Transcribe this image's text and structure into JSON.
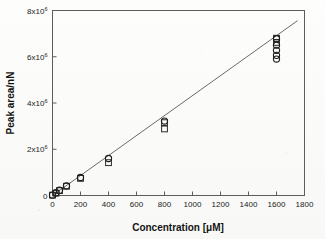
{
  "figure": {
    "background_color": "#fbfbfa",
    "ink_color": "#1a1a1a"
  },
  "chart_data": {
    "type": "scatter",
    "title": "",
    "xlabel": "Concentration [μM]",
    "ylabel": "Peak area/nN",
    "xlim": [
      0,
      1800
    ],
    "ylim": [
      0,
      8000000
    ],
    "xticks": [
      0,
      200,
      400,
      600,
      800,
      1000,
      1200,
      1400,
      1600,
      1800
    ],
    "xtick_labels": [
      "0",
      "200",
      "400",
      "600",
      "800",
      "1000",
      "1200",
      "1400",
      "1600",
      "1800"
    ],
    "yticks": [
      0,
      2000000,
      4000000,
      6000000,
      8000000
    ],
    "ytick_labels": [
      "0",
      "2x10",
      "4x10",
      "6x10",
      "8x10"
    ],
    "ytick_exponent": "6",
    "grid": false,
    "legend": false,
    "legend_position": "none",
    "tick_direction": "in",
    "frame": "box",
    "series": [
      {
        "name": "circles",
        "marker": "open-circle",
        "points": [
          {
            "x": 0,
            "y": 20000
          },
          {
            "x": 25,
            "y": 120000
          },
          {
            "x": 50,
            "y": 230000
          },
          {
            "x": 100,
            "y": 420000
          },
          {
            "x": 200,
            "y": 780000
          },
          {
            "x": 400,
            "y": 1600000
          },
          {
            "x": 800,
            "y": 3220000
          },
          {
            "x": 1600,
            "y": 6780000
          },
          {
            "x": 1600,
            "y": 6500000
          },
          {
            "x": 1600,
            "y": 6280000
          },
          {
            "x": 1600,
            "y": 6060000
          },
          {
            "x": 1600,
            "y": 5900000
          }
        ]
      },
      {
        "name": "squares",
        "marker": "open-square",
        "points": [
          {
            "x": 0,
            "y": 15000
          },
          {
            "x": 25,
            "y": 100000
          },
          {
            "x": 50,
            "y": 210000
          },
          {
            "x": 100,
            "y": 400000
          },
          {
            "x": 200,
            "y": 740000
          },
          {
            "x": 400,
            "y": 1420000
          },
          {
            "x": 800,
            "y": 2880000
          },
          {
            "x": 800,
            "y": 3150000
          },
          {
            "x": 1600,
            "y": 6800000
          },
          {
            "x": 1600,
            "y": 6620000
          }
        ]
      }
    ],
    "fit_line": {
      "name": "linear-regression",
      "x_start": 0,
      "y_start": 0,
      "x_end": 1750,
      "y_end": 7560000
    }
  }
}
